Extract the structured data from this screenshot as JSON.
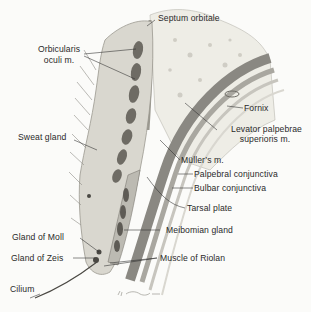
{
  "diagram": {
    "colors": {
      "background": "#fbfbf9",
      "skin": "#d8d6cf",
      "muscle": "#6e6b64",
      "fat": "#ecebe4",
      "levator": "#8a8882",
      "conjunctiva": "#c6c4bd",
      "ink": "#2a2a2a"
    },
    "labels": {
      "septum_orbitale": "Septum orbitale",
      "orbicularis_l1": "Orbicularis",
      "orbicularis_l2": "oculi m.",
      "fornix": "Fornix",
      "levator_l1": "Levator palpebrae",
      "levator_l2": "superioris m.",
      "sweat_gland": "Sweat gland",
      "mullers": "Müller’s m.",
      "palpebral_conj": "Palpebral conjunctiva",
      "bulbar_conj": "Bulbar conjunctiva",
      "tarsal_plate": "Tarsal plate",
      "meibomian_gland": "Meibomian gland",
      "gland_moll": "Gland of Moll",
      "gland_zeis": "Gland of Zeis",
      "muscle_riolan": "Muscle of Riolan",
      "cilium": "Cilium"
    },
    "signature": "F. Netter"
  }
}
